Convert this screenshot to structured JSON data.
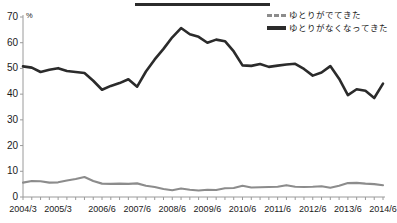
{
  "chart_data": {
    "type": "line",
    "title": "",
    "xlabel": "",
    "ylabel": "%",
    "ylim": [
      0,
      70
    ],
    "ytick_step": 10,
    "yticks": [
      0,
      10,
      20,
      30,
      40,
      50,
      60,
      70
    ],
    "grid": false,
    "legend_position": "top-right",
    "categories": [
      "2004/3",
      "2004/6",
      "2004/9",
      "2004/12",
      "2005/3",
      "2005/6",
      "2005/9",
      "2005/12",
      "2006/3",
      "2006/6",
      "2006/9",
      "2006/12",
      "2007/3",
      "2007/6",
      "2007/9",
      "2007/12",
      "2008/3",
      "2008/6",
      "2008/9",
      "2008/12",
      "2009/3",
      "2009/6",
      "2009/9",
      "2009/12",
      "2010/3",
      "2010/6",
      "2010/9",
      "2010/12",
      "2011/3",
      "2011/6",
      "2011/9",
      "2011/12",
      "2012/3",
      "2012/6",
      "2012/9",
      "2012/12",
      "2013/3",
      "2013/6",
      "2013/9",
      "2013/12",
      "2014/3",
      "2014/6"
    ],
    "tick_labels": [
      "2004/3",
      "2005/3",
      "2006/6",
      "2007/6",
      "2008/6",
      "2009/6",
      "2010/6",
      "2011/6",
      "2012/6",
      "2013/6",
      "2014/6"
    ],
    "tick_label_indices": [
      0,
      4,
      9,
      13,
      17,
      21,
      25,
      29,
      33,
      37,
      41
    ],
    "series": [
      {
        "name": "ゆとりがでてきた",
        "color": "#8c8c8c",
        "style": "dashed",
        "values": [
          5.6,
          6.2,
          6.1,
          5.6,
          5.7,
          6.4,
          7.0,
          7.8,
          6.2,
          5.2,
          5.1,
          5.2,
          5.1,
          5.3,
          4.4,
          3.9,
          3.1,
          2.6,
          3.3,
          2.8,
          2.5,
          2.8,
          2.7,
          3.4,
          3.5,
          4.4,
          3.7,
          3.8,
          3.9,
          4.0,
          4.6,
          4.0,
          3.9,
          4.0,
          4.2,
          3.6,
          4.4,
          5.4,
          5.5,
          5.2,
          5.0,
          4.6
        ]
      },
      {
        "name": "ゆとりがなくなってきた",
        "color": "#2b2b2b",
        "style": "solid",
        "values": [
          50.8,
          50.3,
          48.6,
          49.5,
          50.1,
          49.0,
          48.6,
          48.2,
          45.2,
          41.7,
          43.2,
          44.3,
          45.8,
          42.9,
          48.8,
          53.5,
          57.6,
          62.1,
          65.7,
          63.3,
          62.3,
          60.0,
          61.2,
          60.6,
          56.6,
          51.2,
          51.0,
          51.7,
          50.6,
          51.1,
          51.5,
          51.8,
          49.8,
          47.2,
          48.4,
          50.9,
          46.0,
          39.6,
          41.9,
          41.3,
          38.5,
          44.1
        ]
      }
    ]
  },
  "legend": {
    "items": [
      {
        "label": "ゆとりがでてきた",
        "style": "dashed"
      },
      {
        "label": "ゆとりがなくなってきた",
        "style": "solid"
      }
    ]
  },
  "axis": {
    "unit_label": "%"
  }
}
